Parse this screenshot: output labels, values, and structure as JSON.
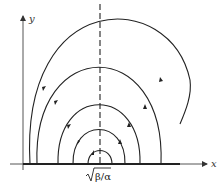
{
  "diagram": {
    "type": "phase-portrait",
    "axes": {
      "x_label": "x",
      "y_label": "y"
    },
    "center_marker_label": "√β/α",
    "center_marker_radicand": "β/α",
    "line_color": "#222222",
    "background": "#ffffff",
    "trajectories": [
      {
        "name": "orbit-1",
        "left_x": 88,
        "right_x": 112,
        "peak_y": 150,
        "arrow": "left-up"
      },
      {
        "name": "orbit-2",
        "left_x": 73,
        "right_x": 125,
        "peak_y": 128,
        "arrow": "both"
      },
      {
        "name": "orbit-3",
        "left_x": 58,
        "right_x": 140,
        "peak_y": 108,
        "arrow": "both"
      },
      {
        "name": "orbit-4",
        "left_x": 37,
        "right_x": 161,
        "peak_y": 70,
        "arrow": "both"
      },
      {
        "name": "orbit-5",
        "left_x": 30,
        "right_x": 176,
        "peak_y": 35,
        "arrow": "both",
        "open_right": true
      }
    ]
  }
}
